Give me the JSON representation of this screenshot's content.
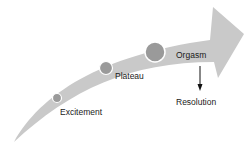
{
  "diagram": {
    "type": "curved-arrow-stages",
    "colors": {
      "arrow_fill": "#c9c9c9",
      "circle_fill": "#9a9a9a",
      "circle_stroke": "#ffffff",
      "text": "#1a1a1a",
      "background": "#ffffff"
    },
    "stages": [
      {
        "id": "excitement",
        "label": "Excitement"
      },
      {
        "id": "plateau",
        "label": "Plateau"
      },
      {
        "id": "orgasm",
        "label": "Orgasm"
      }
    ],
    "resolution": {
      "label": "Resolution",
      "arrow": "down-arrow"
    }
  }
}
